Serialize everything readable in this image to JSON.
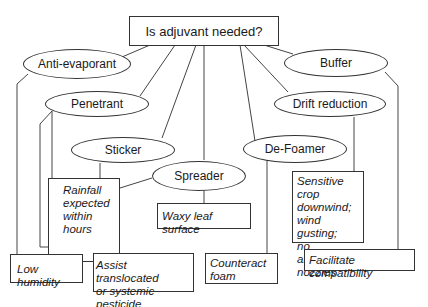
{
  "question": "Is adjuvant needed?",
  "adjuvants": [
    {
      "id": "anti-evaporant",
      "label": "Anti-evaporant"
    },
    {
      "id": "penetrant",
      "label": "Penetrant"
    },
    {
      "id": "sticker",
      "label": "Sticker"
    },
    {
      "id": "spreader",
      "label": "Spreader"
    },
    {
      "id": "de-foamer",
      "label": "De-Foamer"
    },
    {
      "id": "drift-reduction",
      "label": "Drift reduction"
    },
    {
      "id": "buffer",
      "label": "Buffer"
    }
  ],
  "conditions": [
    {
      "id": "rainfall",
      "for": "sticker",
      "label": "Rainfall\nexpected\nwithin\nhours"
    },
    {
      "id": "waxy-leaf",
      "for": "spreader",
      "label": "Waxy leaf surface"
    },
    {
      "id": "sensitive-crop",
      "for": "drift-reduction",
      "label": "Sensitive crop\ndownwind;\nwind gusting;\nno alternative\nnozzles"
    },
    {
      "id": "low-humidity",
      "for": "anti-evaporant",
      "label": "Low humidity"
    },
    {
      "id": "assist-translocated",
      "for": "penetrant",
      "label": "Assist translocated\nor systemic pesticide"
    },
    {
      "id": "counteract-foam",
      "for": "de-foamer",
      "label": "Counteract\nfoam"
    },
    {
      "id": "facilitate-compatibility",
      "for": "buffer",
      "label": "Facilitate compatibility"
    }
  ]
}
